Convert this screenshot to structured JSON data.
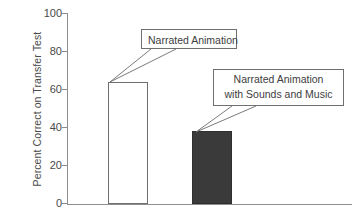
{
  "chart_data": {
    "type": "bar",
    "title": "",
    "xlabel": "",
    "ylabel": "Percent Correct on Transfer Test",
    "ylim": [
      0,
      100
    ],
    "yticks": [
      0,
      20,
      40,
      60,
      80,
      100
    ],
    "ytick_labels": [
      "0",
      "20",
      "40",
      "60",
      "80",
      "100"
    ],
    "grid": false,
    "legend": "none",
    "categories": [
      "Narrated Animation",
      "Narrated Animation with Sounds and Music"
    ],
    "values": [
      64,
      38
    ],
    "series": [
      {
        "name": "Percent Correct on Transfer Test",
        "values": [
          64,
          38
        ]
      }
    ],
    "bars": [
      {
        "label": "Narrated Animation",
        "value": 64,
        "fill": "#ffffff",
        "edge": "#6f6f6f",
        "style": "open"
      },
      {
        "label": "Narrated Animation with Sounds and Music",
        "value": 38,
        "fill": "#3a3a3a",
        "edge": "#2f2f2f",
        "style": "solid"
      }
    ],
    "annotations": [
      {
        "id": "callout-1",
        "lines": [
          "Narrated Animation"
        ],
        "points_to": "bar-1-top"
      },
      {
        "id": "callout-2",
        "lines": [
          "Narrated Animation",
          "with Sounds and Music"
        ],
        "points_to": "bar-2-top"
      }
    ]
  },
  "colors": {
    "axis": "#8e8e8e",
    "text": "#3d3d3d",
    "bar_open_fill": "#ffffff",
    "bar_open_edge": "#6f6f6f",
    "bar_solid_fill": "#3a3a3a",
    "bar_solid_edge": "#2f2f2f",
    "leader_line": "#6b6b6b",
    "background": "#ffffff"
  }
}
